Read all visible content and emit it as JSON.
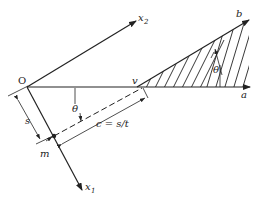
{
  "diagram": {
    "type": "geometry-figure",
    "colors": {
      "ink": "#222222",
      "background": "#ffffff"
    },
    "labels": {
      "origin": "O",
      "axis_x2": "x",
      "axis_x2_sub": "2",
      "axis_x1": "x",
      "axis_x1_sub": "1",
      "vertex": "v",
      "ray_b": "b",
      "ray_a": "a",
      "angle_right": "θ",
      "angle_left": "θ",
      "distance_s": "s",
      "point_m": "m",
      "distance_c": "c = s/t"
    }
  }
}
